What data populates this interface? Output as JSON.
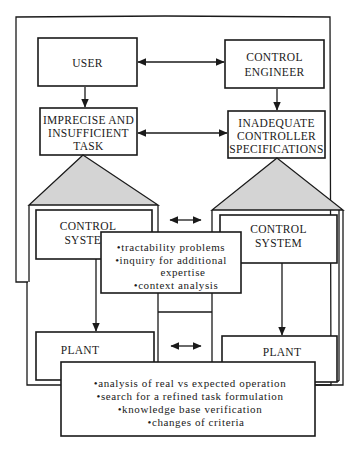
{
  "diagram": {
    "nodes": {
      "user": {
        "lines": [
          "USER"
        ]
      },
      "control_engineer": {
        "lines": [
          "CONTROL",
          "ENGINEER"
        ]
      },
      "imprecise_task": {
        "lines": [
          "IMPRECISE AND",
          "INSUFFICIENT",
          "TASK"
        ]
      },
      "inadequate_specs": {
        "lines": [
          "INADEQUATE",
          "CONTROLLER",
          "SPECIFICATIONS"
        ]
      },
      "control_system_left": {
        "lines": [
          "CONTROL",
          "SYSTEM"
        ]
      },
      "control_system_right": {
        "lines": [
          "CONTROL",
          "SYSTEM"
        ]
      },
      "plant_left": {
        "lines": [
          "PLANT"
        ]
      },
      "plant_right": {
        "lines": [
          "PLANT"
        ]
      }
    },
    "notes": {
      "middle": [
        "•tractability problems",
        "•inquiry for additional",
        "expertise",
        "•context analysis"
      ],
      "bottom": [
        "•analysis of real vs expected operation",
        "•search for a refined task formulation",
        "•knowledge base verification",
        "•changes of criteria"
      ]
    },
    "edges": [
      {
        "from": "user",
        "to": "control_engineer",
        "type": "bidirectional"
      },
      {
        "from": "user",
        "to": "imprecise_task",
        "type": "directed"
      },
      {
        "from": "control_engineer",
        "to": "inadequate_specs",
        "type": "directed"
      },
      {
        "from": "imprecise_task",
        "to": "inadequate_specs",
        "type": "bidirectional"
      },
      {
        "from": "control_system_left",
        "to": "control_system_right",
        "type": "bidirectional"
      },
      {
        "from": "control_system_left",
        "to": "plant_left",
        "type": "directed"
      },
      {
        "from": "control_system_right",
        "to": "plant_right",
        "type": "directed"
      },
      {
        "from": "plant_left",
        "to": "plant_right",
        "type": "bidirectional"
      }
    ]
  }
}
